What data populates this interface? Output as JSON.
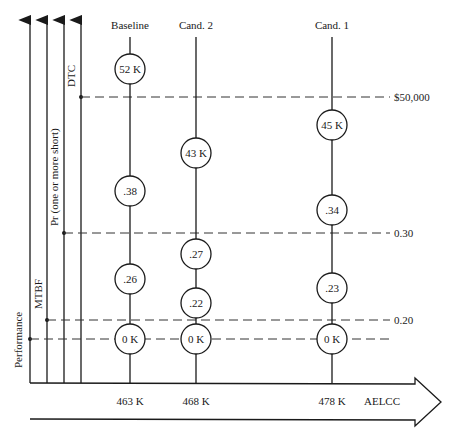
{
  "diagram": {
    "axes": [
      {
        "label": "Performance",
        "x": 30
      },
      {
        "label": "MTBF",
        "x": 47
      },
      {
        "label": "Pr (one or more short)",
        "x": 64
      },
      {
        "label": "DTC",
        "x": 81
      }
    ],
    "thresholds": [
      {
        "label": "$50,000",
        "y": 97,
        "from_x": 81
      },
      {
        "label": "0.30",
        "y": 233,
        "from_x": 64
      },
      {
        "label": "0.20",
        "y": 320,
        "from_x": 47
      },
      {
        "label": "",
        "y": 339,
        "from_x": 30
      }
    ],
    "columns": [
      {
        "label": "Baseline",
        "x": 130,
        "aelcc": "463 K",
        "nodes": [
          {
            "text": "52 K",
            "y": 69
          },
          {
            "text": ".38",
            "y": 191
          },
          {
            "text": ".26",
            "y": 279
          },
          {
            "text": "0 K",
            "y": 339
          }
        ]
      },
      {
        "label": "Cand.  2",
        "x": 196,
        "aelcc": "468 K",
        "nodes": [
          {
            "text": "43 K",
            "y": 153
          },
          {
            "text": ".27",
            "y": 254
          },
          {
            "text": ".22",
            "y": 303
          },
          {
            "text": "0 K",
            "y": 339
          }
        ]
      },
      {
        "label": "Cand.  1",
        "x": 332,
        "aelcc": "478 K",
        "nodes": [
          {
            "text": "45 K",
            "y": 125
          },
          {
            "text": ".34",
            "y": 210
          },
          {
            "text": ".23",
            "y": 288
          },
          {
            "text": "0 K",
            "y": 339
          }
        ]
      }
    ],
    "x_axis_label": "AELCC"
  }
}
